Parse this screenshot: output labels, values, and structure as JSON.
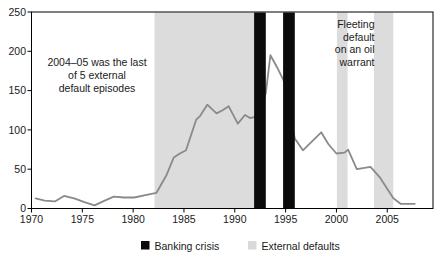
{
  "chart_data": {
    "type": "line",
    "title": "",
    "x_axis": {
      "ticks": [
        1970,
        1975,
        1980,
        1985,
        1990,
        1995,
        2000,
        2005
      ],
      "range": [
        1970,
        2009.5
      ]
    },
    "y_axis": {
      "ticks": [
        0,
        50,
        100,
        150,
        200,
        250
      ],
      "range": [
        0,
        250
      ]
    },
    "grid": false,
    "series": [
      {
        "name": "default-index-line",
        "color": "#8a8a8a",
        "points": [
          [
            1970.4,
            13
          ],
          [
            1971.3,
            10
          ],
          [
            1972.3,
            9
          ],
          [
            1973.2,
            16
          ],
          [
            1974.2,
            13
          ],
          [
            1975.2,
            8
          ],
          [
            1976.2,
            4
          ],
          [
            1977.2,
            10
          ],
          [
            1978.1,
            15
          ],
          [
            1979.1,
            14
          ],
          [
            1980.1,
            14
          ],
          [
            1981.2,
            17
          ],
          [
            1982.3,
            20
          ],
          [
            1983.3,
            43
          ],
          [
            1984.0,
            65
          ],
          [
            1984.6,
            70
          ],
          [
            1985.2,
            74
          ],
          [
            1986.2,
            113
          ],
          [
            1986.6,
            118
          ],
          [
            1987.3,
            132
          ],
          [
            1988.2,
            121
          ],
          [
            1988.8,
            125
          ],
          [
            1989.4,
            130
          ],
          [
            1990.3,
            108
          ],
          [
            1991.0,
            119
          ],
          [
            1991.5,
            115
          ],
          [
            1992.4,
            118
          ],
          [
            1993.05,
            147
          ],
          [
            1993.5,
            195
          ],
          [
            1994.1,
            181
          ],
          [
            1994.8,
            163
          ],
          [
            1995.4,
            120
          ],
          [
            1995.9,
            89
          ],
          [
            1996.7,
            74
          ],
          [
            1998.5,
            97
          ],
          [
            1999.2,
            82
          ],
          [
            2000.0,
            70
          ],
          [
            2000.8,
            71
          ],
          [
            2001.15,
            75
          ],
          [
            2002.0,
            50
          ],
          [
            2003.35,
            53
          ],
          [
            2004.25,
            40
          ],
          [
            2004.9,
            27
          ],
          [
            2005.6,
            13
          ],
          [
            2006.3,
            6
          ],
          [
            2007.7,
            6
          ]
        ]
      }
    ],
    "bands": {
      "external_defaults": {
        "color": "#dcdcdc",
        "ranges": [
          [
            1982.1,
            1991.9
          ],
          [
            2000.05,
            2001.1
          ],
          [
            2003.7,
            2005.6
          ]
        ]
      },
      "banking_crises": {
        "color": "#0b0b0b",
        "ranges": [
          [
            1991.9,
            1993.05
          ],
          [
            1994.75,
            1995.9
          ]
        ]
      }
    },
    "annotations": [
      {
        "name": "external-defaults-note",
        "lines": [
          "2004–05 was the last",
          "of 5 external",
          "default episodes"
        ],
        "x": 97,
        "y": 66,
        "line_height": 13,
        "align": "middle"
      },
      {
        "name": "oil-warrant-note",
        "lines": [
          "Fleeting",
          "default",
          "on an oil",
          "warrant"
        ],
        "x": 374.5,
        "y": 28,
        "line_height": 12.7,
        "align": "end"
      }
    ],
    "legend": {
      "position": "bottom-center",
      "items": [
        {
          "label": "Banking crisis",
          "color": "#0b0b0b"
        },
        {
          "label": "External defaults",
          "color": "#d9d9d9"
        }
      ]
    },
    "colors": {
      "plot_border": "#000000",
      "axis_text": "#1a1a1a",
      "background": "#ffffff"
    }
  }
}
